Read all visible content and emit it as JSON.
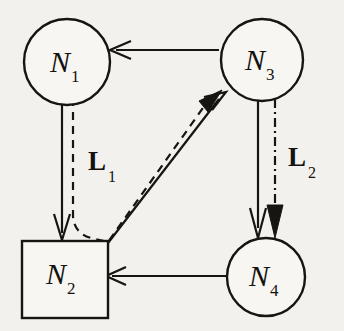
{
  "figure": {
    "type": "network-node-diagram",
    "background_color": "#f2f1ee",
    "ink_color": "#17150f",
    "width": 344,
    "height": 331
  },
  "nodes": [
    {
      "id": "n1",
      "label": "N",
      "subscript": "1",
      "shape": "circle",
      "cx": 67,
      "cy": 62,
      "r": 43
    },
    {
      "id": "n3",
      "label": "N",
      "subscript": "3",
      "shape": "circle",
      "cx": 262,
      "cy": 60,
      "r": 41
    },
    {
      "id": "n2",
      "label": "N",
      "subscript": "2",
      "shape": "square",
      "x": 22,
      "y": 241,
      "width": 86,
      "height": 77
    },
    {
      "id": "n4",
      "label": "N",
      "subscript": "4",
      "shape": "circle",
      "cx": 266,
      "cy": 277,
      "r": 39
    }
  ],
  "edges": [
    {
      "id": "e-n3-n1",
      "from": "n3",
      "to": "n1",
      "style": "solid",
      "arrow": "open",
      "description": "N3 to N1 horizontal"
    },
    {
      "id": "e-n1-n2-solid",
      "from": "n1",
      "to": "n2",
      "style": "solid",
      "arrow": "open",
      "description": "N1 to N2 vertical"
    },
    {
      "id": "e-n1-n2-n3-dashed",
      "from": "n1",
      "to": "n3",
      "style": "dashed",
      "arrow": "filled",
      "description": "dashed path from N1 down past N2 then diagonal to N3"
    },
    {
      "id": "e-n2-n3-solid",
      "from": "n2",
      "to": "n3",
      "style": "solid",
      "arrow": "open",
      "description": "N2 diagonal to N3"
    },
    {
      "id": "e-n3-n4-solid",
      "from": "n3",
      "to": "n4",
      "style": "solid",
      "arrow": "open",
      "description": "N3 to N4 vertical"
    },
    {
      "id": "e-n3-n4-dashdot",
      "from": "n3",
      "to": "n4",
      "style": "dash-dot",
      "arrow": "filled",
      "description": "N3 to N4 vertical dash-dot"
    },
    {
      "id": "e-n4-n2",
      "from": "n4",
      "to": "n2",
      "style": "solid",
      "arrow": "open",
      "description": "N4 to N2 horizontal"
    }
  ],
  "link_labels": [
    {
      "id": "l1",
      "label": "L",
      "subscript": "1",
      "x": 88,
      "y": 170
    },
    {
      "id": "l2",
      "label": "L",
      "subscript": "2",
      "x": 288,
      "y": 166
    }
  ]
}
